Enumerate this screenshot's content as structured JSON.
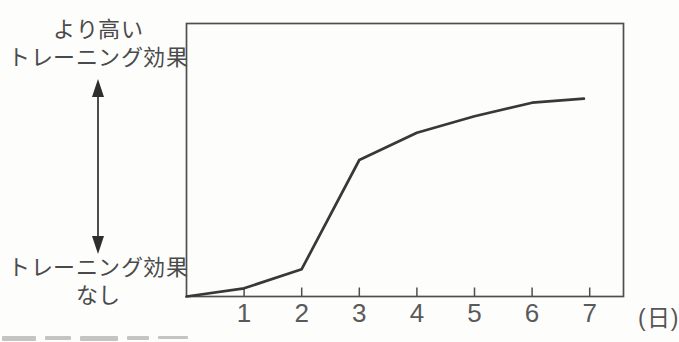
{
  "figure": {
    "y_high_line1": "より高い",
    "y_high_line2": "トレーニング効果",
    "y_low_line1": "トレーニング効果",
    "y_low_line2": "なし",
    "x_unit_label": "(日)"
  },
  "colors": {
    "background": "#fdfdfc",
    "frame": "#4f4f4f",
    "curve": "#383838",
    "arrow": "#2e2e2e",
    "tick_text": "#5a5a5a",
    "label_text": "#4a4a4a"
  },
  "chart_data": {
    "type": "line",
    "title": "",
    "xlabel": "(日)",
    "ylabel_top": "より高いトレーニング効果",
    "ylabel_bottom": "トレーニング効果なし",
    "x_ticks": [
      1,
      2,
      3,
      4,
      5,
      6,
      7
    ],
    "xlim": [
      0,
      7.6
    ],
    "ylim": [
      0,
      100
    ],
    "y_axis_type": "qualitative (no numeric scale shown; 0 = no training effect, higher = greater effect)",
    "grid": false,
    "legend": false,
    "series": [
      {
        "name": "トレーニング効果",
        "x": [
          0,
          1,
          2,
          3,
          4,
          5,
          6,
          6.9
        ],
        "values": [
          0,
          3,
          10,
          50,
          60,
          66,
          71,
          72.5
        ]
      }
    ]
  }
}
